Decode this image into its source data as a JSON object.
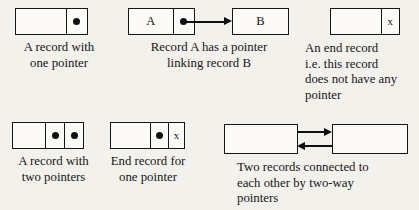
{
  "diagram": {
    "background_color": "#f3f1ec",
    "ink_color": "#16161a"
  },
  "figures": [
    {
      "id": "one-pointer",
      "caption": "A record with\none pointer",
      "cells": [
        {
          "kind": "data",
          "label": ""
        },
        {
          "kind": "pointer",
          "label": "●"
        }
      ]
    },
    {
      "id": "record-a",
      "caption": "Record A has a pointer\nlinking record B",
      "cells": [
        {
          "kind": "data",
          "label": "A"
        },
        {
          "kind": "pointer",
          "label": "●"
        }
      ]
    },
    {
      "id": "record-b",
      "caption": "",
      "cells": [
        {
          "kind": "data",
          "label": "B"
        }
      ]
    },
    {
      "id": "end-record",
      "caption": "An end record\ni.e. this record\ndoes not have any\npointer",
      "cells": [
        {
          "kind": "data",
          "label": ""
        },
        {
          "kind": "null-pointer",
          "label": "x"
        }
      ]
    },
    {
      "id": "two-pointers",
      "caption": "A record with\ntwo pointers",
      "cells": [
        {
          "kind": "data",
          "label": ""
        },
        {
          "kind": "pointer",
          "label": "●"
        },
        {
          "kind": "pointer",
          "label": "●"
        }
      ]
    },
    {
      "id": "end-record-one-pointer",
      "caption": "End record for\none pointer",
      "cells": [
        {
          "kind": "data",
          "label": ""
        },
        {
          "kind": "pointer",
          "label": "●"
        },
        {
          "kind": "null-pointer",
          "label": "x"
        }
      ]
    },
    {
      "id": "two-way-left",
      "caption": "Two records connected to\neach other by two-way\npointers",
      "cells": [
        {
          "kind": "data",
          "label": ""
        }
      ]
    },
    {
      "id": "two-way-right",
      "caption": "",
      "cells": [
        {
          "kind": "data",
          "label": ""
        }
      ]
    }
  ],
  "labels": {
    "record_a": "A",
    "record_b": "B",
    "pointer_dot": "●",
    "null_pointer": "x"
  },
  "captions": {
    "one_pointer": "A record with\none pointer",
    "record_a_links_b": "Record A has a pointer\nlinking record B",
    "end_record": "An end record\ni.e. this record\ndoes not have any\npointer",
    "two_pointers": "A record with\ntwo pointers",
    "end_record_one_pointer": "End record for\none pointer",
    "two_way": "Two records connected to\neach other by two-way\npointers"
  },
  "connectors": [
    {
      "id": "a-to-b",
      "direction": "right",
      "from": "record-a",
      "to": "record-b"
    },
    {
      "id": "two-way-forward",
      "direction": "right",
      "from": "two-way-left",
      "to": "two-way-right"
    },
    {
      "id": "two-way-back",
      "direction": "left",
      "from": "two-way-right",
      "to": "two-way-left"
    }
  ]
}
